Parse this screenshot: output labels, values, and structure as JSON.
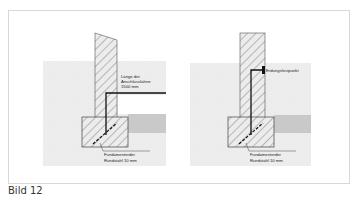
{
  "figure": {
    "caption": "Bild 12",
    "left_panel": {
      "label_length_line1": "Länge der",
      "label_length_line2": "Anschlussfahne",
      "label_length_line3": "1500 mm",
      "label_footing_line1": "Fundamenterder",
      "label_footing_line2": "Rundstahl 10 mm"
    },
    "right_panel": {
      "label_ground_point": "Erdungsfestpunkt",
      "label_footing_line1": "Fundamenterder",
      "label_footing_line2": "Rundstahl 10 mm"
    }
  },
  "colors": {
    "soil": "#eeeeee",
    "slab": "#c8c8c8",
    "hatch_fill": "#e6e6e6",
    "line": "#1a1a1a",
    "frame": "#d8d8d8"
  }
}
